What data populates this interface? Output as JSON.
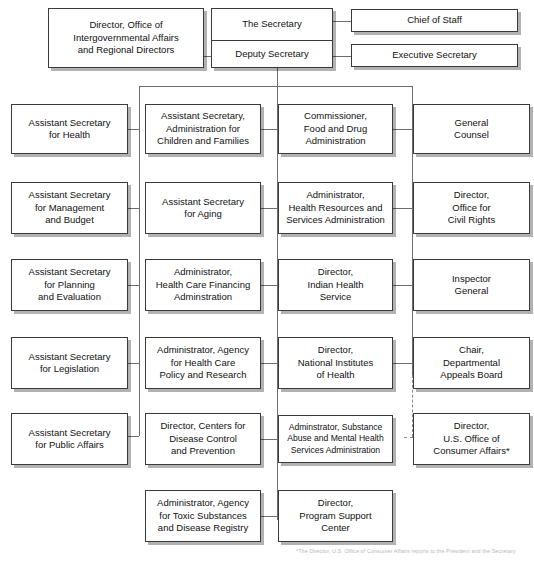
{
  "chart": {
    "type": "org-chart",
    "footnote": "*The Director, U.S. Office of Consumer Affairs reports to the President and the Secretary."
  },
  "top": {
    "intergovernmental": "Director, Office of\nIntergovernmental Affairs\nand Regional Directors",
    "secretary": "The Secretary",
    "deputy_secretary": "Deputy Secretary",
    "chief_of_staff": "Chief of Staff",
    "executive_secretary": "Executive Secretary"
  },
  "columns": [
    {
      "name": "column-1",
      "boxes": [
        "Assistant Secretary\nfor Health",
        "Assistant Secretary\nfor Management\nand Budget",
        "Assistant Secretary\nfor Planning\nand Evaluation",
        "Assistant Secretary\nfor Legislation",
        "Assistant Secretary\nfor Public Affairs"
      ]
    },
    {
      "name": "column-2",
      "boxes": [
        "Assistant Secretary,\nAdministration for\nChildren and Families",
        "Assistant Secretary\nfor Aging",
        "Administrator,\nHealth Care Financing\nAdminstration",
        "Administrator, Agency\nfor Health Care\nPolicy and Research",
        "Director, Centers for\nDisease Control\nand Prevention",
        "Administrator, Agency\nfor Toxic Substances\nand Disease Registry"
      ]
    },
    {
      "name": "column-3",
      "boxes": [
        "Commissioner,\nFood and Drug\nAdministration",
        "Administrator,\nHealth Resources and\nServices Administration",
        "Director,\nIndian Health\nService",
        "Director,\nNational Institutes\nof Health",
        "Adminstrator, Substance\nAbuse and Mental Health\nServices Administration",
        "Director,\nProgram Support\nCenter"
      ]
    },
    {
      "name": "column-4",
      "boxes": [
        "General\nCounsel",
        "Director,\nOffice for\nCivil Rights",
        "Inspector\nGeneral",
        "Chair,\nDepartmental\nAppeals Board",
        "Director,\nU.S. Office of\nConsumer Affairs*"
      ]
    }
  ]
}
